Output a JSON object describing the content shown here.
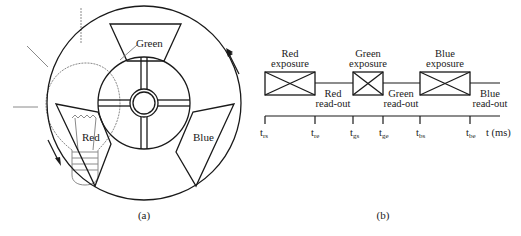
{
  "panel_a": {
    "caption": "(a)",
    "segments": [
      {
        "label": "Green"
      },
      {
        "label": "Red"
      },
      {
        "label": "Blue"
      }
    ]
  },
  "panel_b": {
    "caption": "(b)",
    "axis_label": "t (ms)",
    "exposures": [
      {
        "line1": "Red",
        "line2": "exposure"
      },
      {
        "line1": "Green",
        "line2": "exposure"
      },
      {
        "line1": "Blue",
        "line2": "exposure"
      }
    ],
    "readouts": [
      {
        "line1": "Red",
        "line2": "read-out"
      },
      {
        "line1": "Green",
        "line2": "read-out"
      },
      {
        "line1": "Blue",
        "line2": "read-out"
      }
    ],
    "ticks": [
      {
        "base": "t",
        "sub": "rs"
      },
      {
        "base": "t",
        "sub": "re"
      },
      {
        "base": "t",
        "sub": "gs"
      },
      {
        "base": "t",
        "sub": "ge"
      },
      {
        "base": "t",
        "sub": "bs"
      },
      {
        "base": "t",
        "sub": "be"
      }
    ]
  }
}
